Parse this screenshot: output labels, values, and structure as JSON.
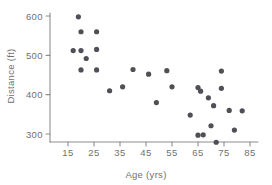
{
  "chart_data": {
    "type": "scatter",
    "title": "",
    "xlabel": "Age (yrs)",
    "ylabel": "Distance (ft)",
    "xlim": [
      10,
      87
    ],
    "ylim": [
      265,
      615
    ],
    "xticks": [
      15,
      25,
      35,
      45,
      55,
      65,
      75,
      85
    ],
    "yticks": [
      300,
      400,
      500,
      600
    ],
    "grid": false,
    "legend": null,
    "marker": {
      "shape": "circle",
      "color": "#4f4f55",
      "radius_px": 2.6
    },
    "points": [
      {
        "x": 19,
        "y": 598
      },
      {
        "x": 17,
        "y": 512
      },
      {
        "x": 20,
        "y": 560
      },
      {
        "x": 20,
        "y": 512
      },
      {
        "x": 20,
        "y": 463
      },
      {
        "x": 22,
        "y": 492
      },
      {
        "x": 26,
        "y": 560
      },
      {
        "x": 26,
        "y": 515
      },
      {
        "x": 26,
        "y": 463
      },
      {
        "x": 31,
        "y": 410
      },
      {
        "x": 36,
        "y": 420
      },
      {
        "x": 40,
        "y": 464
      },
      {
        "x": 46,
        "y": 452
      },
      {
        "x": 49,
        "y": 380
      },
      {
        "x": 53,
        "y": 461
      },
      {
        "x": 55,
        "y": 420
      },
      {
        "x": 62,
        "y": 348
      },
      {
        "x": 65,
        "y": 418
      },
      {
        "x": 65,
        "y": 297
      },
      {
        "x": 66,
        "y": 409
      },
      {
        "x": 67,
        "y": 298
      },
      {
        "x": 69,
        "y": 392
      },
      {
        "x": 70,
        "y": 321
      },
      {
        "x": 71,
        "y": 372
      },
      {
        "x": 72,
        "y": 279
      },
      {
        "x": 74,
        "y": 416
      },
      {
        "x": 74,
        "y": 460
      },
      {
        "x": 77,
        "y": 360
      },
      {
        "x": 79,
        "y": 310
      },
      {
        "x": 82,
        "y": 359
      }
    ]
  },
  "axes": {
    "x_tick_labels": [
      "15",
      "25",
      "35",
      "45",
      "55",
      "65",
      "75",
      "85"
    ],
    "y_tick_labels": [
      "300",
      "400",
      "500",
      "600"
    ],
    "x_axis_title": "Age (yrs)",
    "y_axis_title": "Distance (ft)"
  }
}
